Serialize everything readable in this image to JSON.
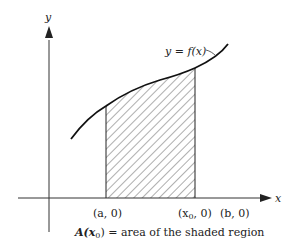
{
  "diagram": {
    "axes": {
      "x_label": "x",
      "y_label": "y"
    },
    "curve_label": "y = f(x)",
    "points": {
      "a": "(a, 0)",
      "x0_prefix": "(x",
      "x0_sub": "0",
      "x0_suffix": ", 0)",
      "b": "(b, 0)"
    },
    "caption": {
      "prefix": "A(x",
      "sub": "0",
      "suffix": ") = area of the shaded region"
    },
    "colors": {
      "ink": "#222222",
      "background": "#ffffff"
    }
  }
}
